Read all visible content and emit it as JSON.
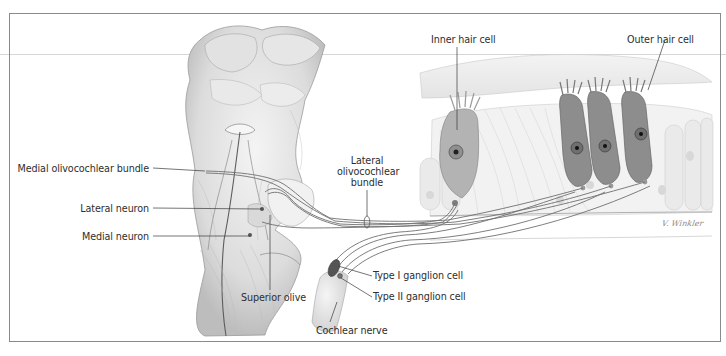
{
  "figure": {
    "colors": {
      "frame": "#8a8a8a",
      "leader_line": "#3a3a3a",
      "fiber": "#6f6f6f",
      "hair_cell_outer": "#8d8d8d",
      "hair_cell_inner": "#b3b3b3",
      "brainstem_shade": "#cfcfcf",
      "background": "#ffffff"
    }
  },
  "labels": {
    "medial_olivocochlear_bundle": "Medial olivocochlear bundle",
    "lateral_neuron": "Lateral neuron",
    "medial_neuron": "Medial neuron",
    "superior_olive": "Superior olive",
    "lateral_olivocochlear_bundle_line1": "Lateral",
    "lateral_olivocochlear_bundle_line2": "olivocochlear",
    "lateral_olivocochlear_bundle_line3": "bundle",
    "inner_hair_cell": "Inner hair cell",
    "outer_hair_cell": "Outer hair cell",
    "type_i_ganglion_cell": "Type I ganglion cell",
    "type_ii_ganglion_cell": "Type II ganglion cell",
    "cochlear_nerve": "Cochlear nerve"
  },
  "signature": "V. Winkler"
}
